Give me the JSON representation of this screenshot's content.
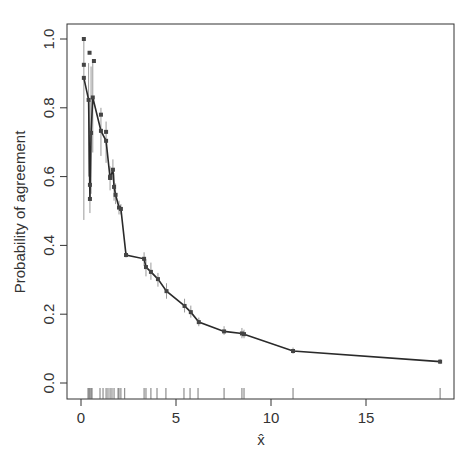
{
  "chart_data": {
    "type": "line",
    "title": "",
    "xlabel": "x̂",
    "ylabel": "Probability of agreement",
    "xlim": [
      -0.7,
      19.7
    ],
    "ylim": [
      -0.05,
      1.04
    ],
    "xticks": [
      0,
      5,
      10,
      15
    ],
    "xtick_labels": [
      "0",
      "5",
      "10",
      "15"
    ],
    "yticks": [
      0.0,
      0.2,
      0.4,
      0.6,
      0.8,
      1.0
    ],
    "ytick_labels": [
      "0.0",
      "0.2",
      "0.4",
      "0.6",
      "0.8",
      "1.0"
    ],
    "grid": false,
    "legend": null,
    "series": [
      {
        "name": "Probability of agreement",
        "style": "line+points+errorbars",
        "points": [
          {
            "x": 0.15,
            "y": 0.887,
            "lo": 0.474,
            "hi": 1.0
          },
          {
            "x": 0.4,
            "y": 0.823,
            "lo": 0.6,
            "hi": 0.93
          },
          {
            "x": 0.47,
            "y": 0.535,
            "lo": 0.494,
            "hi": 0.82
          },
          {
            "x": 0.53,
            "y": 0.727,
            "lo": 0.55,
            "hi": 0.92
          },
          {
            "x": 0.62,
            "y": 0.83,
            "lo": 0.67,
            "hi": 0.93
          },
          {
            "x": 1.05,
            "y": 0.733,
            "lo": 0.66,
            "hi": 0.8
          },
          {
            "x": 1.32,
            "y": 0.704,
            "lo": 0.64,
            "hi": 0.76
          },
          {
            "x": 1.53,
            "y": 0.596,
            "lo": 0.56,
            "hi": 0.63
          },
          {
            "x": 1.68,
            "y": 0.62,
            "lo": 0.59,
            "hi": 0.65
          },
          {
            "x": 1.74,
            "y": 0.57,
            "lo": 0.53,
            "hi": 0.61
          },
          {
            "x": 1.82,
            "y": 0.547,
            "lo": 0.52,
            "hi": 0.58
          },
          {
            "x": 2.0,
            "y": 0.51,
            "lo": 0.49,
            "hi": 0.53
          },
          {
            "x": 2.1,
            "y": 0.506,
            "lo": 0.49,
            "hi": 0.52
          },
          {
            "x": 2.37,
            "y": 0.372,
            "lo": 0.365,
            "hi": 0.38
          },
          {
            "x": 3.32,
            "y": 0.361,
            "lo": 0.34,
            "hi": 0.38
          },
          {
            "x": 3.42,
            "y": 0.337,
            "lo": 0.31,
            "hi": 0.36
          },
          {
            "x": 3.68,
            "y": 0.323,
            "lo": 0.3,
            "hi": 0.35
          },
          {
            "x": 4.05,
            "y": 0.302,
            "lo": 0.28,
            "hi": 0.32
          },
          {
            "x": 4.5,
            "y": 0.267,
            "lo": 0.245,
            "hi": 0.29
          },
          {
            "x": 5.45,
            "y": 0.224,
            "lo": 0.205,
            "hi": 0.245
          },
          {
            "x": 5.78,
            "y": 0.206,
            "lo": 0.19,
            "hi": 0.225
          },
          {
            "x": 6.2,
            "y": 0.177,
            "lo": 0.165,
            "hi": 0.19
          },
          {
            "x": 7.53,
            "y": 0.15,
            "lo": 0.14,
            "hi": 0.165
          },
          {
            "x": 8.47,
            "y": 0.144,
            "lo": 0.13,
            "hi": 0.16
          },
          {
            "x": 8.58,
            "y": 0.142,
            "lo": 0.13,
            "hi": 0.155
          },
          {
            "x": 11.16,
            "y": 0.093,
            "lo": 0.085,
            "hi": 0.103
          },
          {
            "x": 18.9,
            "y": 0.062,
            "lo": 0.055,
            "hi": 0.07
          }
        ],
        "extra_points": [
          {
            "x": 0.15,
            "y": 1.0
          },
          {
            "x": 0.15,
            "y": 0.925
          },
          {
            "x": 0.45,
            "y": 0.96
          },
          {
            "x": 0.68,
            "y": 0.936
          },
          {
            "x": 0.47,
            "y": 0.576
          },
          {
            "x": 1.05,
            "y": 0.78
          },
          {
            "x": 1.32,
            "y": 0.73
          },
          {
            "x": 1.53,
            "y": 0.6
          }
        ]
      }
    ],
    "rug": [
      0.37,
      0.42,
      0.47,
      0.53,
      0.58,
      1.0,
      1.16,
      1.32,
      1.42,
      1.53,
      1.63,
      1.74,
      1.95,
      2.0,
      2.1,
      2.3,
      3.32,
      3.42,
      3.68,
      4.0,
      4.47,
      5.42,
      5.74,
      6.16,
      7.53,
      8.47,
      8.58,
      11.16,
      18.9
    ]
  },
  "colors": {
    "line": "#2a2a2a",
    "point": "#444444",
    "errorbar": "#9a9a9a",
    "axis": "#333333"
  }
}
